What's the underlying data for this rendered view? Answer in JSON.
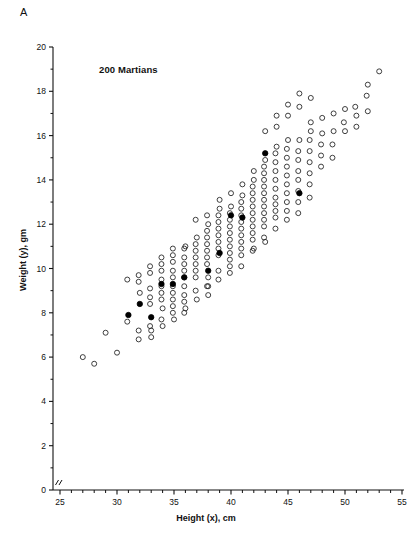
{
  "figure": {
    "panel_label": "A",
    "annotation": "200 Martians"
  },
  "chart_data": {
    "type": "scatter",
    "title": "",
    "annotation": "200 Martians",
    "panel_label": "A",
    "xlabel": "Height (x), cm",
    "ylabel": "Weight (y), gm",
    "xlim": [
      25,
      55
    ],
    "ylim": [
      0,
      20
    ],
    "xticks": [
      25,
      30,
      35,
      40,
      45,
      50,
      55
    ],
    "xtick_labels": [
      "25",
      "30",
      "35",
      "40",
      "45",
      "50",
      "55"
    ],
    "xminor_step": 1,
    "yticks": [
      0,
      2,
      4,
      6,
      8,
      10,
      12,
      14,
      16,
      18,
      20
    ],
    "ytick_labels": [
      "0",
      "2",
      "4",
      "6",
      "8",
      "10",
      "12",
      "14",
      "16",
      "18",
      "20"
    ],
    "yminor_step": 1,
    "grid": false,
    "legend": "none",
    "axis_break_x": true,
    "marker_open": "open-circle",
    "marker_filled": "filled-circle",
    "n_points": 200,
    "series": [
      {
        "name": "Martians (open circles)",
        "marker": "open-circle",
        "color": "#222222",
        "points": [
          [
            27.0,
            6.0
          ],
          [
            28.0,
            5.7
          ],
          [
            30.0,
            6.2
          ],
          [
            29.0,
            7.1
          ],
          [
            30.9,
            7.6
          ],
          [
            31.9,
            6.8
          ],
          [
            31.9,
            7.2
          ],
          [
            33.0,
            7.2
          ],
          [
            32.9,
            7.4
          ],
          [
            33.9,
            7.7
          ],
          [
            34.0,
            8.2
          ],
          [
            34.9,
            8.0
          ],
          [
            34.9,
            8.3
          ],
          [
            35.9,
            8.0
          ],
          [
            32.0,
            8.9
          ],
          [
            32.9,
            8.4
          ],
          [
            32.9,
            8.7
          ],
          [
            32.9,
            9.1
          ],
          [
            33.9,
            8.6
          ],
          [
            33.9,
            8.9
          ],
          [
            33.9,
            9.2
          ],
          [
            33.9,
            9.5
          ],
          [
            34.9,
            8.6
          ],
          [
            34.9,
            8.9
          ],
          [
            34.9,
            9.2
          ],
          [
            34.9,
            9.6
          ],
          [
            35.9,
            8.5
          ],
          [
            35.9,
            8.8
          ],
          [
            35.9,
            9.2
          ],
          [
            30.9,
            9.5
          ],
          [
            31.9,
            9.4
          ],
          [
            31.9,
            9.7
          ],
          [
            32.9,
            9.8
          ],
          [
            32.9,
            10.1
          ],
          [
            33.9,
            9.9
          ],
          [
            33.9,
            10.2
          ],
          [
            34.9,
            9.9
          ],
          [
            34.9,
            10.3
          ],
          [
            34.9,
            10.6
          ],
          [
            35.9,
            9.6
          ],
          [
            35.9,
            9.9
          ],
          [
            35.9,
            10.2
          ],
          [
            35.9,
            10.5
          ],
          [
            36.0,
            11.0
          ],
          [
            36.9,
            9.6
          ],
          [
            36.9,
            9.9
          ],
          [
            36.9,
            10.2
          ],
          [
            36.9,
            10.5
          ],
          [
            36.9,
            10.8
          ],
          [
            36.9,
            11.1
          ],
          [
            37.0,
            11.4
          ],
          [
            37.9,
            10.2
          ],
          [
            37.9,
            10.5
          ],
          [
            37.9,
            10.8
          ],
          [
            37.9,
            11.1
          ],
          [
            37.9,
            11.4
          ],
          [
            37.9,
            11.7
          ],
          [
            38.0,
            12.0
          ],
          [
            38.9,
            10.6
          ],
          [
            38.9,
            10.9
          ],
          [
            38.9,
            11.2
          ],
          [
            38.9,
            11.5
          ],
          [
            38.9,
            11.8
          ],
          [
            38.9,
            12.1
          ],
          [
            38.9,
            12.4
          ],
          [
            39.0,
            12.7
          ],
          [
            38.0,
            9.2
          ],
          [
            38.0,
            9.6
          ],
          [
            38.9,
            9.5
          ],
          [
            38.9,
            9.9
          ],
          [
            39.9,
            10.1
          ],
          [
            39.9,
            10.4
          ],
          [
            39.9,
            10.7
          ],
          [
            39.9,
            11.0
          ],
          [
            39.9,
            11.3
          ],
          [
            39.9,
            11.6
          ],
          [
            39.9,
            11.9
          ],
          [
            39.9,
            12.2
          ],
          [
            39.9,
            12.5
          ],
          [
            40.0,
            12.8
          ],
          [
            40.9,
            10.6
          ],
          [
            40.9,
            10.9
          ],
          [
            40.9,
            11.2
          ],
          [
            40.9,
            11.5
          ],
          [
            40.9,
            11.8
          ],
          [
            40.9,
            12.1
          ],
          [
            40.9,
            12.4
          ],
          [
            40.9,
            12.7
          ],
          [
            40.9,
            13.0
          ],
          [
            41.0,
            13.3
          ],
          [
            41.9,
            11.3
          ],
          [
            41.9,
            11.6
          ],
          [
            41.9,
            11.9
          ],
          [
            41.9,
            12.2
          ],
          [
            41.9,
            12.5
          ],
          [
            41.9,
            12.8
          ],
          [
            41.9,
            13.1
          ],
          [
            41.9,
            13.4
          ],
          [
            41.9,
            13.7
          ],
          [
            42.0,
            14.0
          ],
          [
            42.9,
            11.9
          ],
          [
            42.9,
            12.2
          ],
          [
            42.9,
            12.5
          ],
          [
            42.9,
            12.8
          ],
          [
            42.9,
            13.1
          ],
          [
            42.9,
            13.4
          ],
          [
            42.9,
            13.7
          ],
          [
            42.9,
            14.0
          ],
          [
            42.9,
            14.3
          ],
          [
            42.9,
            14.6
          ],
          [
            43.0,
            14.9
          ],
          [
            43.9,
            12.3
          ],
          [
            43.9,
            12.6
          ],
          [
            43.9,
            12.9
          ],
          [
            43.9,
            13.2
          ],
          [
            43.9,
            13.6
          ],
          [
            43.9,
            14.0
          ],
          [
            43.9,
            14.4
          ],
          [
            43.9,
            14.8
          ],
          [
            43.9,
            15.2
          ],
          [
            44.0,
            15.5
          ],
          [
            44.9,
            12.6
          ],
          [
            44.9,
            13.0
          ],
          [
            44.9,
            13.4
          ],
          [
            44.9,
            13.8
          ],
          [
            44.9,
            14.2
          ],
          [
            44.9,
            14.6
          ],
          [
            44.9,
            15.0
          ],
          [
            44.9,
            15.4
          ],
          [
            45.0,
            15.8
          ],
          [
            45.9,
            13.0
          ],
          [
            45.9,
            13.5
          ],
          [
            45.9,
            14.0
          ],
          [
            45.9,
            14.4
          ],
          [
            45.9,
            14.9
          ],
          [
            45.9,
            15.3
          ],
          [
            46.0,
            15.8
          ],
          [
            46.9,
            13.8
          ],
          [
            46.9,
            14.3
          ],
          [
            46.9,
            14.8
          ],
          [
            46.9,
            15.3
          ],
          [
            46.9,
            15.8
          ],
          [
            47.0,
            16.2
          ],
          [
            47.9,
            14.6
          ],
          [
            47.9,
            15.1
          ],
          [
            47.9,
            15.6
          ],
          [
            48.0,
            16.1
          ],
          [
            48.9,
            15.0
          ],
          [
            48.9,
            15.6
          ],
          [
            49.0,
            16.2
          ],
          [
            47.0,
            16.6
          ],
          [
            48.0,
            16.8
          ],
          [
            49.0,
            17.0
          ],
          [
            49.9,
            16.6
          ],
          [
            50.0,
            17.2
          ],
          [
            50.9,
            17.3
          ],
          [
            51.9,
            17.8
          ],
          [
            52.0,
            18.3
          ],
          [
            53.0,
            18.9
          ],
          [
            51.0,
            16.9
          ],
          [
            52.0,
            17.1
          ],
          [
            50.0,
            16.2
          ],
          [
            51.0,
            16.4
          ],
          [
            43.0,
            16.2
          ],
          [
            44.0,
            16.4
          ],
          [
            45.0,
            16.9
          ],
          [
            46.0,
            17.3
          ],
          [
            44.0,
            16.9
          ],
          [
            45.0,
            17.4
          ],
          [
            46.0,
            17.9
          ],
          [
            47.0,
            17.7
          ],
          [
            36.9,
            12.2
          ],
          [
            37.9,
            12.4
          ],
          [
            39.0,
            13.1
          ],
          [
            40.0,
            13.4
          ],
          [
            41.0,
            13.8
          ],
          [
            42.0,
            14.4
          ],
          [
            36.0,
            8.2
          ],
          [
            35.0,
            7.7
          ],
          [
            36.9,
            9.0
          ],
          [
            37.9,
            9.2
          ],
          [
            34.0,
            7.4
          ],
          [
            33.0,
            6.9
          ],
          [
            39.9,
            9.8
          ],
          [
            40.9,
            10.1
          ],
          [
            41.9,
            10.8
          ],
          [
            42.9,
            11.4
          ],
          [
            43.9,
            11.8
          ],
          [
            44.9,
            12.2
          ],
          [
            45.9,
            12.5
          ],
          [
            46.9,
            13.2
          ],
          [
            37.0,
            8.6
          ],
          [
            38.0,
            8.8
          ],
          [
            42.0,
            10.9
          ],
          [
            43.0,
            11.2
          ],
          [
            35.9,
            10.9
          ],
          [
            34.9,
            10.9
          ],
          [
            33.9,
            10.5
          ]
        ]
      },
      {
        "name": "Highlighted Martians (filled circles)",
        "marker": "filled-circle",
        "color": "#000000",
        "points": [
          [
            31.0,
            7.9
          ],
          [
            32.0,
            8.4
          ],
          [
            33.0,
            7.8
          ],
          [
            33.9,
            9.3
          ],
          [
            34.9,
            9.3
          ],
          [
            35.9,
            9.6
          ],
          [
            38.0,
            9.9
          ],
          [
            39.0,
            10.7
          ],
          [
            40.0,
            12.4
          ],
          [
            41.0,
            12.3
          ],
          [
            43.0,
            15.2
          ],
          [
            46.0,
            13.4
          ]
        ]
      }
    ]
  }
}
